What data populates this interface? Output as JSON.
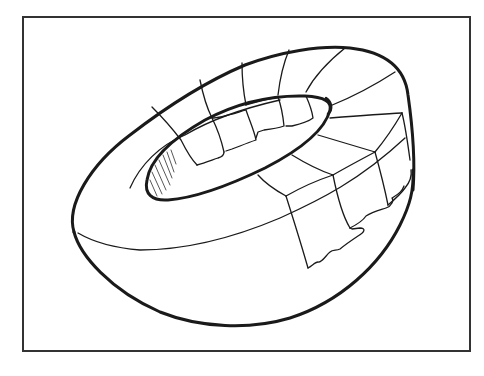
{
  "figure": {
    "description": "Line drawing of a hollowed half-sphere (bowl) with a toroidal inner opening, its upper surface divided into a curved grid of patches with torn/ragged edges",
    "colors": {
      "background": "#ffffff",
      "ink": "#1a1a1a",
      "frame": "#333333"
    },
    "frame": {
      "x": 23,
      "y": 17,
      "width": 447,
      "height": 334
    }
  }
}
